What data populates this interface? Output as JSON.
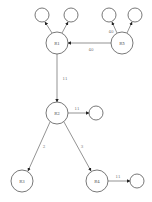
{
  "diagram": {
    "type": "directed-graph",
    "nodes": {
      "r1": {
        "label": "R1"
      },
      "r5": {
        "label": "R5"
      },
      "r2": {
        "label": "R2"
      },
      "r3": {
        "label": "R3"
      },
      "r4": {
        "label": "R4"
      }
    },
    "edges": {
      "r5_r1": {
        "label": "40"
      },
      "r5_leaf_a": {
        "label": "40"
      },
      "r1_r2": {
        "label": "11"
      },
      "r2_leaf": {
        "label": "11"
      },
      "r2_r3": {
        "label": "2"
      },
      "r2_r4": {
        "label": "3"
      },
      "r4_leaf": {
        "label": "11"
      }
    }
  }
}
